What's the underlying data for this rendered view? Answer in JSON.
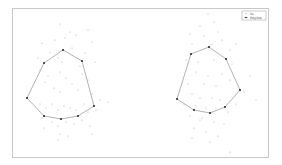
{
  "chart_data": {
    "type": "scatter",
    "title": "",
    "xlabel": "",
    "ylabel": "",
    "grid": false,
    "legend_position": "upper right",
    "legend": [
      "Xs",
      "Polyline"
    ],
    "frame": {
      "x0": 12,
      "y0": 8,
      "x1": 268,
      "y1": 157
    },
    "series": [
      {
        "name": "Xs",
        "kind": "scatter",
        "color": "#9a9a9a",
        "points": [
          [
            60,
            24
          ],
          [
            70,
            32
          ],
          [
            88,
            30
          ],
          [
            42,
            43
          ],
          [
            55,
            40
          ],
          [
            65,
            38
          ],
          [
            76,
            35
          ],
          [
            92,
            42
          ],
          [
            50,
            52
          ],
          [
            72,
            48
          ],
          [
            85,
            53
          ],
          [
            38,
            58
          ],
          [
            58,
            58
          ],
          [
            62,
            62
          ],
          [
            80,
            66
          ],
          [
            95,
            62
          ],
          [
            40,
            70
          ],
          [
            48,
            76
          ],
          [
            60,
            72
          ],
          [
            66,
            78
          ],
          [
            82,
            74
          ],
          [
            88,
            80
          ],
          [
            45,
            82
          ],
          [
            54,
            88
          ],
          [
            60,
            92
          ],
          [
            72,
            84
          ],
          [
            78,
            90
          ],
          [
            92,
            94
          ],
          [
            100,
            100
          ],
          [
            108,
            102
          ],
          [
            40,
            104
          ],
          [
            46,
            108
          ],
          [
            52,
            104
          ],
          [
            58,
            110
          ],
          [
            64,
            106
          ],
          [
            70,
            108
          ],
          [
            76,
            110
          ],
          [
            84,
            104
          ],
          [
            88,
            112
          ],
          [
            96,
            110
          ],
          [
            42,
            118
          ],
          [
            52,
            122
          ],
          [
            58,
            126
          ],
          [
            66,
            122
          ],
          [
            74,
            124
          ],
          [
            82,
            120
          ],
          [
            90,
            126
          ],
          [
            60,
            134
          ],
          [
            68,
            136
          ],
          [
            44,
            128
          ],
          [
            92,
            134
          ],
          [
            58,
            140
          ],
          [
            208,
            14
          ],
          [
            214,
            22
          ],
          [
            200,
            26
          ],
          [
            218,
            32
          ],
          [
            190,
            34
          ],
          [
            204,
            36
          ],
          [
            222,
            40
          ],
          [
            236,
            44
          ],
          [
            192,
            44
          ],
          [
            212,
            44
          ],
          [
            230,
            50
          ],
          [
            186,
            60
          ],
          [
            198,
            62
          ],
          [
            214,
            60
          ],
          [
            232,
            64
          ],
          [
            196,
            72
          ],
          [
            208,
            76
          ],
          [
            222,
            74
          ],
          [
            250,
            76
          ],
          [
            188,
            84
          ],
          [
            204,
            84
          ],
          [
            216,
            86
          ],
          [
            230,
            80
          ],
          [
            244,
            92
          ],
          [
            256,
            100
          ],
          [
            192,
            94
          ],
          [
            200,
            98
          ],
          [
            212,
            98
          ],
          [
            220,
            100
          ],
          [
            236,
            104
          ],
          [
            184,
            104
          ],
          [
            196,
            106
          ],
          [
            206,
            108
          ],
          [
            216,
            108
          ],
          [
            228,
            112
          ],
          [
            190,
            116
          ],
          [
            202,
            118
          ],
          [
            214,
            122
          ],
          [
            224,
            124
          ],
          [
            194,
            128
          ],
          [
            206,
            132
          ],
          [
            218,
            136
          ],
          [
            192,
            138
          ],
          [
            210,
            142
          ],
          [
            230,
            152
          ],
          [
            200,
            120
          ]
        ]
      },
      {
        "name": "Polyline",
        "kind": "polygon",
        "color": "#222222",
        "polygons": [
          [
            [
              63,
              50
            ],
            [
              82,
              61
            ],
            [
              94,
              106
            ],
            [
              78,
              116
            ],
            [
              61,
              119
            ],
            [
              44,
              116
            ],
            [
              27,
              98
            ],
            [
              44,
              63
            ]
          ],
          [
            [
              209,
              47
            ],
            [
              226,
              59
            ],
            [
              240,
              90
            ],
            [
              225,
              107
            ],
            [
              210,
              113
            ],
            [
              194,
              110
            ],
            [
              177,
              99
            ],
            [
              191,
              54
            ]
          ]
        ]
      }
    ]
  }
}
